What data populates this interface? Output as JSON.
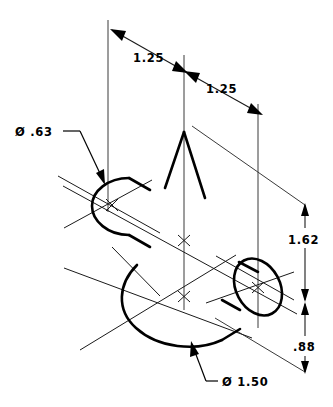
{
  "drawing": {
    "title": "Isometric cylinder intersection dimensioned drawing",
    "background_color": "#ffffff",
    "line_color": "#000000",
    "dimensions": [
      {
        "id": "len-left",
        "label": "1.25",
        "x": 133,
        "y": 62,
        "kind": "linear-horizontal-iso"
      },
      {
        "id": "len-right",
        "label": "1.25",
        "x": 206,
        "y": 93,
        "kind": "linear-horizontal-iso"
      },
      {
        "id": "height-upper",
        "label": "1.62",
        "x": 290,
        "y": 240,
        "kind": "linear-vertical"
      },
      {
        "id": "height-lower",
        "label": ".88",
        "x": 296,
        "y": 347,
        "kind": "linear-vertical"
      }
    ],
    "diameters": [
      {
        "id": "small-bore",
        "label": "Ø .63",
        "x": 15,
        "y": 134,
        "target": "small-cylinder-left-end"
      },
      {
        "id": "large-bore",
        "label": "Ø 1.50",
        "x": 222,
        "y": 385,
        "target": "large-cylinder-bottom-arc"
      }
    ],
    "features": [
      {
        "name": "small-cylinder",
        "diameter": ".63"
      },
      {
        "name": "large-cylinder",
        "diameter": "1.50"
      },
      {
        "name": "intersection-vee"
      }
    ]
  }
}
